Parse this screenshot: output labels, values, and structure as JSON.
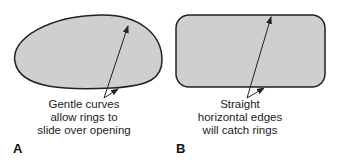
{
  "panels": [
    {
      "id": "A",
      "label": "A",
      "shape": "ellipse-egg",
      "caption_lines": [
        "Gentle curves",
        "allow rings to",
        "slide over opening"
      ]
    },
    {
      "id": "B",
      "label": "B",
      "shape": "rounded-rectangle",
      "caption_lines": [
        "Straight",
        "horizontal edges",
        "will catch rings"
      ]
    }
  ],
  "colors": {
    "fill": "#cfcfcf",
    "stroke": "#222222",
    "text": "#222222"
  }
}
